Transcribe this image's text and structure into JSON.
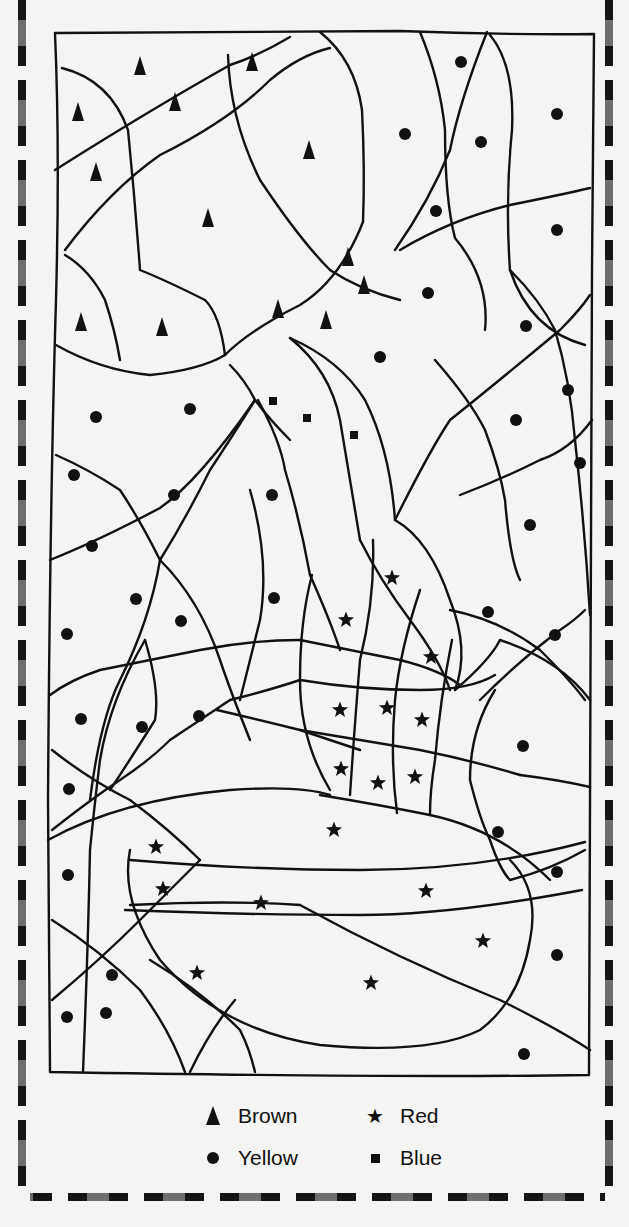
{
  "legend": {
    "items": [
      {
        "key": "brown",
        "label": "Brown",
        "symbol": "triangle-icon"
      },
      {
        "key": "red",
        "label": "Red",
        "symbol": "star-icon"
      },
      {
        "key": "yellow",
        "label": "Yellow",
        "symbol": "circle-icon"
      },
      {
        "key": "blue",
        "label": "Blue",
        "symbol": "square-icon"
      }
    ]
  },
  "colors": {
    "ink": "#111111",
    "paper": "#f4f4f2",
    "dash_dark": "#151515",
    "dash_gray": "#6e6e6e"
  },
  "markers": {
    "brown": [
      [
        140,
        66
      ],
      [
        78,
        112
      ],
      [
        175,
        102
      ],
      [
        252,
        62
      ],
      [
        96,
        172
      ],
      [
        309,
        150
      ],
      [
        208,
        218
      ],
      [
        348,
        257
      ],
      [
        364,
        285
      ],
      [
        81,
        322
      ],
      [
        162,
        327
      ],
      [
        278,
        309
      ],
      [
        326,
        320
      ]
    ],
    "yellow": [
      [
        461,
        62
      ],
      [
        405,
        134
      ],
      [
        481,
        142
      ],
      [
        557,
        114
      ],
      [
        436,
        211
      ],
      [
        557,
        230
      ],
      [
        428,
        293
      ],
      [
        526,
        326
      ],
      [
        380,
        357
      ],
      [
        568,
        390
      ],
      [
        190,
        409
      ],
      [
        96,
        417
      ],
      [
        516,
        420
      ],
      [
        580,
        463
      ],
      [
        74,
        475
      ],
      [
        174,
        495
      ],
      [
        272,
        495
      ],
      [
        530,
        525
      ],
      [
        92,
        546
      ],
      [
        136,
        599
      ],
      [
        488,
        612
      ],
      [
        181,
        621
      ],
      [
        274,
        598
      ],
      [
        555,
        635
      ],
      [
        67,
        634
      ],
      [
        81,
        719
      ],
      [
        142,
        727
      ],
      [
        199,
        716
      ],
      [
        523,
        746
      ],
      [
        69,
        789
      ],
      [
        68,
        875
      ],
      [
        112,
        975
      ],
      [
        106,
        1013
      ],
      [
        67,
        1017
      ],
      [
        557,
        872
      ],
      [
        557,
        955
      ],
      [
        524,
        1054
      ],
      [
        498,
        832
      ]
    ],
    "red": [
      [
        392,
        578
      ],
      [
        346,
        620
      ],
      [
        431,
        657
      ],
      [
        340,
        710
      ],
      [
        387,
        708
      ],
      [
        422,
        720
      ],
      [
        341,
        769
      ],
      [
        378,
        783
      ],
      [
        415,
        777
      ],
      [
        334,
        830
      ],
      [
        156,
        847
      ],
      [
        163,
        889
      ],
      [
        261,
        903
      ],
      [
        426,
        891
      ],
      [
        483,
        941
      ],
      [
        197,
        973
      ],
      [
        371,
        983
      ]
    ],
    "blue": [
      [
        273,
        401
      ],
      [
        307,
        418
      ],
      [
        354,
        435
      ]
    ]
  }
}
